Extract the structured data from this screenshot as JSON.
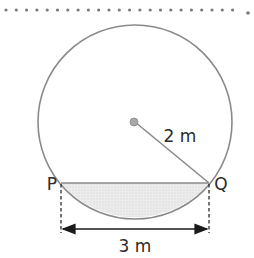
{
  "diagram": {
    "type": "circle-segment",
    "labels": {
      "radius": "2 m",
      "point_left": "P",
      "point_right": "Q",
      "chord_length": "3 m"
    },
    "colors": {
      "stroke": "#8a8a8a",
      "segment_fill": "#e4e4e4",
      "dot_border": "#7a7a7a",
      "text": "#2b2b2b",
      "dimension": "#1a1a1a"
    }
  }
}
